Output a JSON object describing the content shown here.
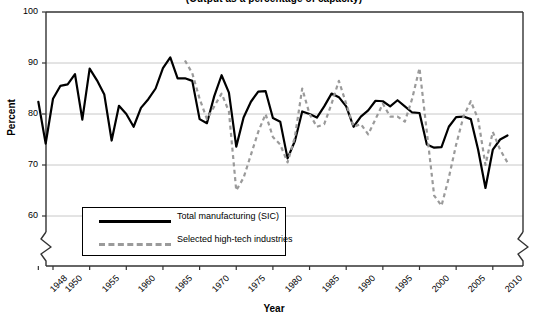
{
  "chart_data": {
    "type": "line",
    "title": "(Output as a percentage of capacity)",
    "xlabel": "Year",
    "ylabel": "Percent",
    "ylim": [
      55,
      100
    ],
    "yticks": [
      60,
      70,
      80,
      90,
      100
    ],
    "xlim": [
      1948,
      2012
    ],
    "xticks": [
      1948,
      1950,
      1955,
      1960,
      1965,
      1970,
      1975,
      1980,
      1985,
      1990,
      1995,
      2000,
      2005,
      2010
    ],
    "grid": "horizontal",
    "axis_break": "y-axis broken below 60",
    "legend_position": "lower-left inside plot",
    "colors": {
      "total_manufacturing": "#000000",
      "high_tech": "#9a9a9a"
    },
    "series": [
      {
        "name": "Total manufacturing (SIC)",
        "style": "solid",
        "color": "#000000",
        "x": [
          1948,
          1949,
          1950,
          1951,
          1952,
          1953,
          1954,
          1955,
          1956,
          1957,
          1958,
          1959,
          1960,
          1961,
          1962,
          1963,
          1964,
          1965,
          1966,
          1967,
          1968,
          1969,
          1970,
          1971,
          1972,
          1973,
          1974,
          1975,
          1976,
          1977,
          1978,
          1979,
          1980,
          1981,
          1982,
          1983,
          1984,
          1985,
          1986,
          1987,
          1988,
          1989,
          1990,
          1991,
          1992,
          1993,
          1994,
          1995,
          1996,
          1997,
          1998,
          1999,
          2000,
          2001,
          2002,
          2003,
          2004,
          2005,
          2006,
          2007,
          2008,
          2009,
          2010,
          2011,
          2012
        ],
        "values": [
          82.4,
          74.2,
          83.0,
          85.5,
          85.8,
          87.8,
          78.9,
          88.9,
          86.6,
          83.8,
          74.8,
          81.6,
          80.0,
          77.5,
          81.2,
          82.9,
          85.0,
          89.0,
          91.1,
          87.0,
          87.0,
          86.5,
          79.0,
          78.2,
          83.5,
          87.6,
          84.2,
          73.6,
          79.3,
          82.4,
          84.4,
          84.5,
          79.2,
          78.5,
          71.3,
          74.7,
          80.5,
          80.0,
          79.3,
          81.5,
          84.0,
          83.3,
          81.5,
          77.5,
          79.5,
          80.7,
          82.6,
          82.5,
          81.5,
          82.7,
          81.5,
          80.3,
          80.2,
          74.0,
          73.4,
          73.5,
          77.5,
          79.4,
          79.5,
          79.0,
          73.0,
          65.5,
          73.0,
          75.0,
          75.8
        ]
      },
      {
        "name": "Selected high-tech industries",
        "style": "dashed",
        "color": "#9a9a9a",
        "x": [
          1968,
          1969,
          1970,
          1971,
          1972,
          1973,
          1974,
          1975,
          1976,
          1977,
          1978,
          1979,
          1980,
          1981,
          1982,
          1983,
          1984,
          1985,
          1986,
          1987,
          1988,
          1989,
          1990,
          1991,
          1992,
          1993,
          1994,
          1995,
          1996,
          1997,
          1998,
          1999,
          2000,
          2001,
          2002,
          2003,
          2004,
          2005,
          2006,
          2007,
          2008,
          2009,
          2010,
          2011,
          2012
        ],
        "values": [
          90.5,
          88.0,
          83.0,
          79.0,
          81.5,
          84.0,
          80.5,
          65.0,
          67.5,
          72.0,
          76.5,
          80.0,
          75.5,
          74.0,
          70.5,
          75.5,
          85.0,
          80.0,
          77.5,
          78.0,
          82.0,
          86.5,
          82.0,
          77.5,
          78.0,
          76.0,
          79.0,
          82.0,
          79.5,
          79.5,
          78.5,
          83.0,
          89.0,
          76.5,
          64.0,
          62.0,
          67.5,
          74.0,
          79.5,
          82.5,
          79.0,
          70.0,
          76.5,
          73.0,
          70.5
        ]
      }
    ]
  },
  "legend": {
    "items": [
      {
        "label": "Total manufacturing (SIC)",
        "style": "solid"
      },
      {
        "label": "Selected high-tech industries",
        "style": "dashed"
      }
    ]
  },
  "yticklabels": [
    "100",
    "90",
    "80",
    "70",
    "60"
  ],
  "xticklabels": [
    "1948",
    "1950",
    "1955",
    "1960",
    "1965",
    "1970",
    "1975",
    "1980",
    "1985",
    "1990",
    "1995",
    "2000",
    "2005",
    "2010"
  ]
}
